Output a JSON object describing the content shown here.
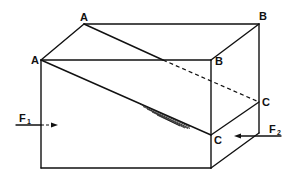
{
  "diagram": {
    "type": "shear-box",
    "vertices": {
      "back_top_left": {
        "label": "A",
        "x": 84,
        "y": 24
      },
      "back_top_right": {
        "label": "B",
        "x": 259,
        "y": 24
      },
      "front_top_left": {
        "label": "A",
        "x": 41,
        "y": 60
      },
      "front_top_right": {
        "label": "B",
        "x": 211,
        "y": 60
      },
      "front_right_mid": {
        "label": "C",
        "x": 211,
        "y": 135
      },
      "back_right_mid": {
        "label": "C",
        "x": 259,
        "y": 102
      }
    },
    "labels": {
      "a_back": "A",
      "a_front": "A",
      "b_back": "B",
      "b_front": "B",
      "c_back": "C",
      "c_front": "C",
      "f1_main": "F",
      "f1_sub": "1",
      "f2_main": "F",
      "f2_sub": "2"
    },
    "forces": [
      {
        "name": "F1",
        "direction": "right",
        "position": "left face"
      },
      {
        "name": "F2",
        "direction": "left",
        "position": "right face"
      }
    ]
  }
}
